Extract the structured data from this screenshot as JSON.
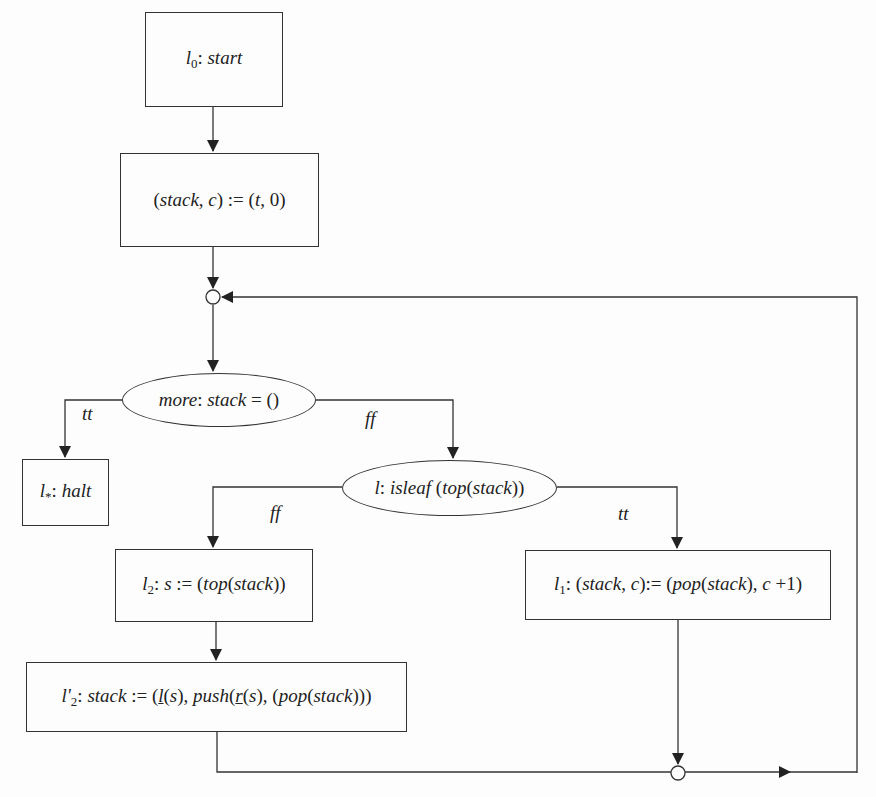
{
  "diagram": {
    "type": "flowchart",
    "nodes": {
      "start": {
        "label_prefix": "l",
        "label_sub": "0",
        "text": "start"
      },
      "init": {
        "lhs": "stack",
        "c": "c",
        "assign": ":=",
        "rhs_t": "t",
        "rhs_zero": "0"
      },
      "test_more": {
        "name": "more",
        "expr": "stack",
        "eq": "= ()"
      },
      "halt": {
        "label_prefix": "l",
        "label_sub": "*",
        "text": "halt"
      },
      "test_isleaf": {
        "name": "l",
        "fn": "isleaf",
        "arg_fn": "top",
        "arg": "stack"
      },
      "l2": {
        "label_prefix": "l",
        "label_sub": "2",
        "var": "s",
        "assign": ":=",
        "fn": "top",
        "arg": "stack"
      },
      "l1": {
        "label_prefix": "l",
        "label_sub": "1",
        "lhs": "stack",
        "c": "c",
        "assign": ":=",
        "fn": "pop",
        "arg": "stack",
        "inc": "c",
        "plus": "+1"
      },
      "l2prime": {
        "label_prefix": "l'",
        "label_sub": "2",
        "lhs": "stack",
        "assign": ":=",
        "l_fn": "l",
        "s": "s",
        "push": "push",
        "r_fn": "r",
        "pop": "pop",
        "arg": "stack"
      }
    },
    "edge_labels": {
      "more_tt": "tt",
      "more_ff": "ff",
      "isleaf_ff": "ff",
      "isleaf_tt": "tt"
    },
    "colors": {
      "line": "#333333",
      "background": "#fdfdfd"
    }
  }
}
